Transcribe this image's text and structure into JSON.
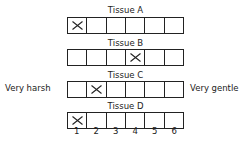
{
  "rows": [
    {
      "title": "Tissue A",
      "checked": 1
    },
    {
      "title": "Tissue B",
      "checked": 4
    },
    {
      "title": "Tissue C",
      "checked": 2
    },
    {
      "title": "Tissue D",
      "checked": 1
    }
  ],
  "scale": [
    "1",
    "2",
    "3",
    "4",
    "5",
    "6"
  ],
  "left_label": "Very harsh",
  "right_label": "Very gentle"
}
